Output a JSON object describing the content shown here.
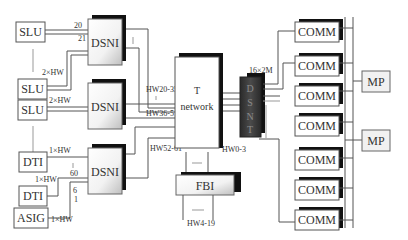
{
  "diagram": {
    "type": "telecom-switch-block-diagram",
    "colors": {
      "line": "#555555",
      "shadow": "#111111",
      "dsnt_fill": "#3a3a3a",
      "box_fill": "#ffffff",
      "mp_fill": "#f1f1f1"
    },
    "left_units": {
      "slu_1": "SLU",
      "slu_2": "SLU",
      "slu_3": "SLU",
      "dti_1": "DTI",
      "dti_2": "DTI",
      "asig": "ASIG"
    },
    "dsni": {
      "top": "DSNI",
      "middle": "DSNI",
      "bottom": "DSNI"
    },
    "t_network": {
      "line1": "T",
      "line2": "network"
    },
    "dsnt": {
      "letters": [
        "D",
        "S",
        "N",
        "T"
      ]
    },
    "fbi": "FBI",
    "comm_boxes": [
      "COMM",
      "COMM",
      "COMM",
      "COMM",
      "COMM",
      "COMM",
      "COMM"
    ],
    "mp_boxes": [
      "MP",
      "MP"
    ],
    "labels": {
      "slu1_top_port": "20",
      "slu1_bottom_port": "21",
      "slu2_hw": "2×HW",
      "slu3_hw": "2×HW",
      "dti1_hw": "1×HW",
      "dti2_hw": "1×HW",
      "asig_hw": "1×HW",
      "port_60": "60",
      "port_6": "6",
      "port_1": "1",
      "hw_20_35": "HW20-35",
      "hw_36_51": "HW36-51",
      "hw_52_61": "HW52-61",
      "hw_0_3": "HW0-3",
      "hw_4_19": "HW4-19",
      "dsnt_16x2m": "16×2M"
    }
  }
}
